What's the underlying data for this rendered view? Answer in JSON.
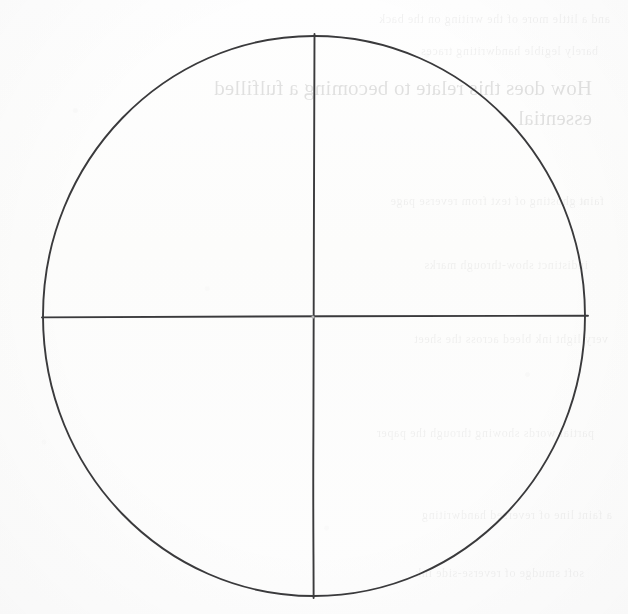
{
  "page": {
    "kind": "scanned-worksheet-page",
    "background_color": "#fdfdfc",
    "ink_color": "#3a3a3c",
    "width": 628,
    "height": 614
  },
  "diagram": {
    "name": "quadrant-circle",
    "circle": {
      "center_x": 314,
      "center_y": 316,
      "radius_x": 271,
      "radius_y": 280,
      "left_edge_x": 43,
      "right_edge_x": 585,
      "top_edge_y": 36,
      "bottom_edge_y": 596
    },
    "vertical_diameter": {
      "x": 314,
      "y_start": 34,
      "y_end": 598
    },
    "horizontal_diameter": {
      "y": 316,
      "x_start": 42,
      "x_end": 588
    },
    "center_mark": {
      "x": 314,
      "y": 316
    },
    "quadrant_labels": [
      "",
      "",
      "",
      ""
    ]
  },
  "bleedthrough": {
    "note": "faint mirrored text showing through from the reverse side of the sheet",
    "line1": "How does this relate to becoming a fulfilled",
    "line2": "essential",
    "residue": [
      "and a little more of the writing on the back",
      "barely legible handwriting traces",
      "faint ghosting of text from reverse page",
      "indistinct show-through marks",
      "very light ink bleed across the sheet",
      "partial words showing through the paper",
      "a faint line of reversed handwriting",
      "soft smudge of reverse-side ink"
    ]
  }
}
